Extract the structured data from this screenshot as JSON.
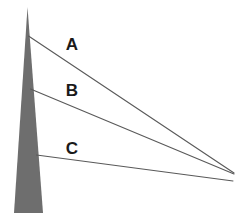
{
  "figure": {
    "background_color": "#ffffff",
    "width": 246,
    "height": 224
  },
  "chart_data": {
    "type": "diagram",
    "xlabel": "",
    "ylabel": "",
    "xlim": [
      0,
      246
    ],
    "ylim": [
      0,
      224
    ],
    "grid": false,
    "legend": null,
    "shapes": [
      {
        "name": "tower",
        "kind": "polygon",
        "fill": "#6e6e6e",
        "stroke": "none",
        "points": [
          [
            27.5,
            7
          ],
          [
            43,
            213
          ],
          [
            14,
            213
          ]
        ]
      }
    ],
    "rays": [
      {
        "label": "A",
        "start": [
          28.5,
          36
        ],
        "end": [
          234,
          173
        ],
        "stroke": "#595959",
        "stroke_width": 1.1,
        "label_pos": [
          72,
          46
        ]
      },
      {
        "label": "B",
        "start": [
          30.5,
          89
        ],
        "end": [
          234,
          174
        ],
        "stroke": "#595959",
        "stroke_width": 1.1,
        "label_pos": [
          72,
          92
        ]
      },
      {
        "label": "C",
        "start": [
          36.5,
          155
        ],
        "end": [
          233,
          181
        ],
        "stroke": "#595959",
        "stroke_width": 1.1,
        "label_pos": [
          72,
          150
        ]
      }
    ],
    "labels": [
      {
        "text": "A",
        "x": 72,
        "y": 46
      },
      {
        "text": "B",
        "x": 72,
        "y": 92
      },
      {
        "text": "C",
        "x": 72,
        "y": 150
      }
    ],
    "colors": {
      "tower_fill": "#6e6e6e",
      "ray_stroke": "#595959",
      "label_text": "#1a1a1a",
      "background": "#ffffff"
    }
  }
}
